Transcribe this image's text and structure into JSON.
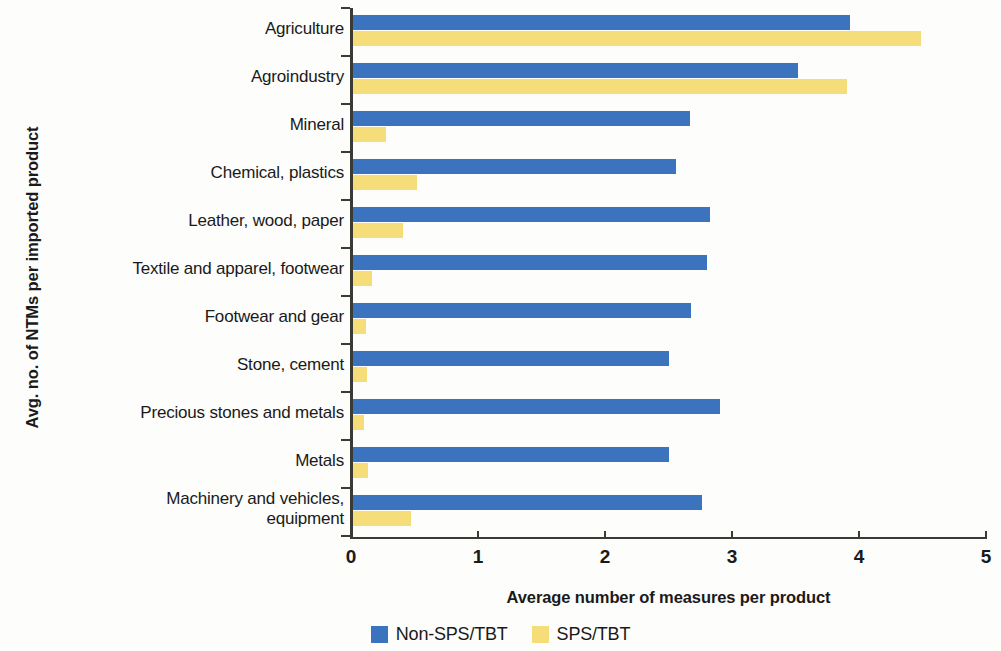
{
  "chart_data": {
    "type": "bar",
    "orientation": "horizontal",
    "title": "",
    "xlabel": "Average number of measures per product",
    "ylabel": "Avg. no. of NTMs per imported product",
    "xlim": [
      0,
      5
    ],
    "xticks": [
      "0",
      "1",
      "2",
      "3",
      "4",
      "5"
    ],
    "grid": false,
    "legend_position": "bottom",
    "categories": [
      "Agriculture",
      "Agroindustry",
      "Mineral",
      "Chemical, plastics",
      "Leather, wood, paper",
      "Textile and apparel, footwear",
      "Footwear and gear",
      "Stone, cement",
      "Precious stones and metals",
      "Metals",
      "Machinery and vehicles,\nequipment"
    ],
    "series": [
      {
        "name": "Non-SPS/TBT",
        "color": "#3b73be",
        "values": [
          3.91,
          3.5,
          2.65,
          2.54,
          2.81,
          2.79,
          2.66,
          2.49,
          2.89,
          2.49,
          2.75
        ]
      },
      {
        "name": "SPS/TBT",
        "color": "#f5dd79",
        "values": [
          4.47,
          3.89,
          0.26,
          0.5,
          0.39,
          0.15,
          0.1,
          0.11,
          0.09,
          0.12,
          0.46
        ]
      }
    ]
  },
  "legend": {
    "items": [
      {
        "label": "Non-SPS/TBT",
        "color": "#3b73be"
      },
      {
        "label": "SPS/TBT",
        "color": "#f5dd79"
      }
    ]
  }
}
